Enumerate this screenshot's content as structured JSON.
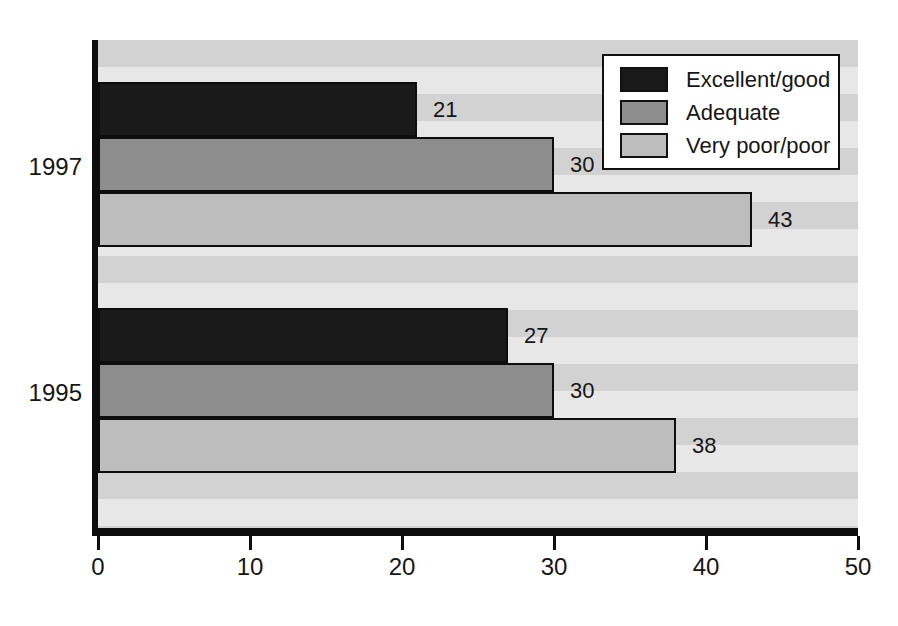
{
  "chart_data": {
    "type": "bar",
    "orientation": "horizontal",
    "categories": [
      "1997",
      "1995"
    ],
    "series": [
      {
        "name": "Excellent/good",
        "color": "#1a1a1a",
        "values": [
          21,
          27
        ]
      },
      {
        "name": "Adequate",
        "color": "#8d8d8d",
        "values": [
          30,
          30
        ]
      },
      {
        "name": "Very poor/poor",
        "color": "#bdbdbd",
        "values": [
          43,
          38
        ]
      }
    ],
    "xlim": [
      0,
      50
    ],
    "x_ticks": [
      0,
      10,
      20,
      30,
      40,
      50
    ],
    "grid": "off",
    "legend_position": "top-right",
    "plot_background_stripes": [
      "#d2d2d2",
      "#e7e7e7"
    ],
    "axis_color": "#0d0d0d",
    "bar_border_color": "#0d0d0d",
    "data_labels_shown": true
  }
}
